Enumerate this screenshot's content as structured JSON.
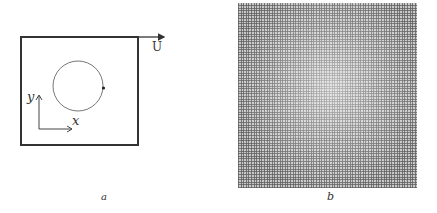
{
  "panel_a": {
    "caption": "a",
    "velocity_label": "U",
    "x_axis_label": "x",
    "y_axis_label": "y",
    "colors": {
      "box": "#333333",
      "circle": "#777777",
      "axes": "#444444"
    }
  },
  "panel_b": {
    "caption": "b",
    "description": "grid mesh",
    "colors": {
      "mesh_line": "#5a5a5a",
      "background": "#c8c8c8"
    }
  }
}
